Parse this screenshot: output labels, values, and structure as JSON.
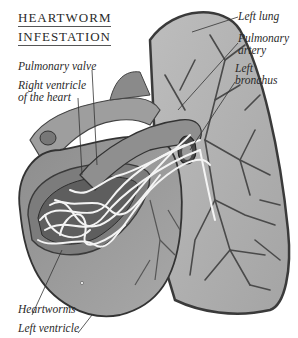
{
  "title": {
    "line1": "HEARTWORM",
    "line2": "INFESTATION"
  },
  "labels": {
    "left_lung": "Left lung",
    "pulmonary_artery_1": "Pulmonary",
    "pulmonary_artery_2": "artery",
    "left_bronchus_1": "Left",
    "left_bronchus_2": "bronchus",
    "pulmonary_valve": "Pulmonary valve",
    "right_ventricle_1": "Right ventricle",
    "right_ventricle_2": "of the heart",
    "heartworms": "Heartworms",
    "left_ventricle": "Left ventricle"
  },
  "colors": {
    "ink": "#2a2a2a",
    "organ_mid": "#9a9a9a",
    "organ_light": "#c8c8c8",
    "organ_dark": "#5a5a5a",
    "worm": "#f4f4f4"
  }
}
